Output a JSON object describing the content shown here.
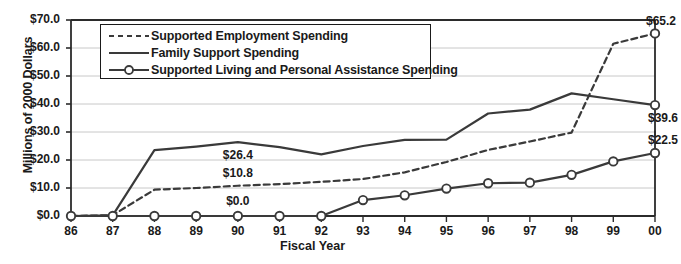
{
  "chart_data": {
    "type": "line",
    "title": "",
    "xlabel": "Fiscal Year",
    "ylabel": "Millions of 2000 Dollars",
    "categories": [
      "86",
      "87",
      "88",
      "89",
      "90",
      "91",
      "92",
      "93",
      "94",
      "95",
      "96",
      "97",
      "98",
      "99",
      "00"
    ],
    "xlim": [
      0,
      14
    ],
    "ylim": [
      0,
      70
    ],
    "yticks": [
      "$0.0",
      "$10.0",
      "$20.0",
      "$30.0",
      "$40.0",
      "$50.0",
      "$60.0",
      "$70.0"
    ],
    "ytick_values": [
      0,
      10,
      20,
      30,
      40,
      50,
      60,
      70
    ],
    "grid": true,
    "legend_position": "top-left-inside",
    "series": [
      {
        "name": "Supported Employment Spending",
        "style": "dashed",
        "markers": false,
        "color": "#3a3a3a",
        "values": [
          0.0,
          0.3,
          9.4,
          10.0,
          10.8,
          11.4,
          12.2,
          13.2,
          15.6,
          19.3,
          23.6,
          26.6,
          29.8,
          61.5,
          65.2
        ]
      },
      {
        "name": "Family Support Spending",
        "style": "solid",
        "markers": false,
        "color": "#3a3a3a",
        "values": [
          0.0,
          0.2,
          23.5,
          24.8,
          26.4,
          24.6,
          22.0,
          25.0,
          27.2,
          27.3,
          36.6,
          38.0,
          43.8,
          41.7,
          39.6
        ]
      },
      {
        "name": "Supported Living and Personal Assistance Spending",
        "style": "solid-markers",
        "markers": true,
        "color": "#3a3a3a",
        "values": [
          0.0,
          0.0,
          0.0,
          0.0,
          0.0,
          0.0,
          0.0,
          5.7,
          7.4,
          9.8,
          11.7,
          11.9,
          14.7,
          19.5,
          22.5
        ]
      }
    ],
    "annotations": [
      {
        "text": "$26.4",
        "x": "90",
        "series": "Family Support Spending",
        "value": 26.4
      },
      {
        "text": "$10.8",
        "x": "90",
        "series": "Supported Employment Spending",
        "value": 10.8
      },
      {
        "text": "$0.0",
        "x": "90",
        "series": "Supported Living and Personal Assistance Spending",
        "value": 0.0
      },
      {
        "text": "$65.2",
        "x": "00",
        "series": "Supported Employment Spending",
        "value": 65.2
      },
      {
        "text": "$39.6",
        "x": "00",
        "series": "Family Support Spending",
        "value": 39.6
      },
      {
        "text": "$22.5",
        "x": "00",
        "series": "Supported Living and Personal Assistance Spending",
        "value": 22.5
      }
    ],
    "colors": {
      "line": "#3a3a3a",
      "axis": "#2b2b2b",
      "grid": "#c8c8c8",
      "background": "#ffffff",
      "text": "#1a1a1a"
    }
  }
}
